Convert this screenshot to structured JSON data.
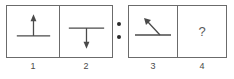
{
  "puzzle": {
    "type": "visual-analogy",
    "separator": "colon-two-dots",
    "question_symbol": "?",
    "colors": {
      "stroke": "#4a4a4a",
      "border": "#6b6b6b",
      "background": "#ffffff",
      "dot": "#2b2b2b",
      "label_text": "#4a4a4a"
    },
    "groups": [
      {
        "name": "left-pair",
        "cells": [
          {
            "label": "1",
            "figure": "horizontal-line-with-up-arrow-above",
            "description": "A horizontal line with a vertical arrow rising from its midpoint, pointing up."
          },
          {
            "label": "2",
            "figure": "horizontal-line-with-down-arrow-below",
            "description": "A horizontal line with a vertical arrow descending from its midpoint, pointing down."
          }
        ]
      },
      {
        "name": "right-pair",
        "cells": [
          {
            "label": "3",
            "figure": "horizontal-line-with-diagonal-arrow-up-left",
            "description": "A horizontal line with a diagonal arrow from its right end pointing up and to the left."
          },
          {
            "label": "4",
            "figure": "question-mark",
            "description": "Unknown answer cell containing a question mark."
          }
        ]
      }
    ],
    "labels": {
      "cell_1": "1",
      "cell_2": "2",
      "cell_3": "3",
      "cell_4": "4"
    }
  }
}
